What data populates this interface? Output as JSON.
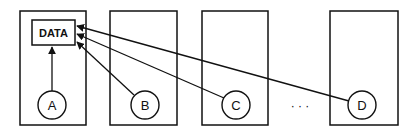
{
  "diagram": {
    "data_label": "DATA",
    "nodes": [
      {
        "id": "A",
        "label": "A"
      },
      {
        "id": "B",
        "label": "B"
      },
      {
        "id": "C",
        "label": "C"
      },
      {
        "id": "D",
        "label": "D"
      }
    ],
    "ellipsis": "· · ·",
    "edges": [
      {
        "from": "A",
        "to": "DATA"
      },
      {
        "from": "B",
        "to": "DATA"
      },
      {
        "from": "C",
        "to": "DATA"
      },
      {
        "from": "D",
        "to": "DATA"
      }
    ],
    "colors": {
      "stroke": "#111111",
      "background": "#ffffff"
    }
  }
}
